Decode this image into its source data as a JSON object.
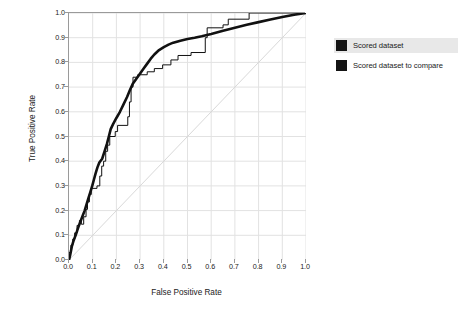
{
  "chart_data": {
    "type": "line",
    "title": "",
    "xlabel": "False Positive Rate",
    "ylabel": "True Positive Rate",
    "xlim": [
      0.0,
      1.0
    ],
    "ylim": [
      0.0,
      1.0
    ],
    "grid": true,
    "legend_position": "right",
    "reference_line": {
      "name": "chance-diagonal",
      "from": [
        0.0,
        0.0
      ],
      "to": [
        1.0,
        1.0
      ],
      "color": "#d8d8d8"
    },
    "xticks": [
      "0.0",
      "0.1",
      "0.2",
      "0.3",
      "0.4",
      "0.5",
      "0.6",
      "0.7",
      "0.8",
      "0.9",
      "1.0"
    ],
    "yticks": [
      "0.0",
      "0.1",
      "0.2",
      "0.3",
      "0.4",
      "0.5",
      "0.6",
      "0.7",
      "0.8",
      "0.9",
      "1.0"
    ],
    "xtick_values": [
      0.0,
      0.1,
      0.2,
      0.3,
      0.4,
      0.5,
      0.6,
      0.7,
      0.8,
      0.9,
      1.0
    ],
    "ytick_values": [
      0.0,
      0.1,
      0.2,
      0.3,
      0.4,
      0.5,
      0.6,
      0.7,
      0.8,
      0.9,
      1.0
    ],
    "series": [
      {
        "name": "Scored dataset",
        "color": "#111111",
        "width": 2.6,
        "style": "smooth",
        "points": [
          [
            0.0,
            0.0
          ],
          [
            0.005,
            0.02
          ],
          [
            0.012,
            0.055
          ],
          [
            0.02,
            0.08
          ],
          [
            0.028,
            0.1
          ],
          [
            0.035,
            0.12
          ],
          [
            0.042,
            0.14
          ],
          [
            0.05,
            0.16
          ],
          [
            0.058,
            0.18
          ],
          [
            0.066,
            0.2
          ],
          [
            0.074,
            0.225
          ],
          [
            0.082,
            0.25
          ],
          [
            0.09,
            0.275
          ],
          [
            0.098,
            0.3
          ],
          [
            0.105,
            0.325
          ],
          [
            0.112,
            0.35
          ],
          [
            0.12,
            0.375
          ],
          [
            0.128,
            0.395
          ],
          [
            0.14,
            0.41
          ],
          [
            0.15,
            0.44
          ],
          [
            0.16,
            0.47
          ],
          [
            0.168,
            0.5
          ],
          [
            0.176,
            0.53
          ],
          [
            0.186,
            0.55
          ],
          [
            0.2,
            0.575
          ],
          [
            0.215,
            0.6
          ],
          [
            0.23,
            0.63
          ],
          [
            0.245,
            0.66
          ],
          [
            0.258,
            0.69
          ],
          [
            0.27,
            0.715
          ],
          [
            0.285,
            0.735
          ],
          [
            0.3,
            0.755
          ],
          [
            0.315,
            0.775
          ],
          [
            0.33,
            0.795
          ],
          [
            0.345,
            0.815
          ],
          [
            0.36,
            0.832
          ],
          [
            0.38,
            0.85
          ],
          [
            0.4,
            0.862
          ],
          [
            0.42,
            0.872
          ],
          [
            0.44,
            0.88
          ],
          [
            0.47,
            0.888
          ],
          [
            0.5,
            0.895
          ],
          [
            0.53,
            0.9
          ],
          [
            0.56,
            0.906
          ],
          [
            0.6,
            0.915
          ],
          [
            0.65,
            0.928
          ],
          [
            0.7,
            0.94
          ],
          [
            0.75,
            0.952
          ],
          [
            0.8,
            0.963
          ],
          [
            0.85,
            0.974
          ],
          [
            0.9,
            0.984
          ],
          [
            0.95,
            0.993
          ],
          [
            1.0,
            1.0
          ]
        ]
      },
      {
        "name": "Scored dataset to compare",
        "color": "#111111",
        "width": 1.0,
        "style": "step",
        "points": [
          [
            0.0,
            0.0
          ],
          [
            0.0,
            0.03
          ],
          [
            0.008,
            0.03
          ],
          [
            0.008,
            0.06
          ],
          [
            0.016,
            0.06
          ],
          [
            0.016,
            0.085
          ],
          [
            0.024,
            0.085
          ],
          [
            0.024,
            0.11
          ],
          [
            0.034,
            0.11
          ],
          [
            0.034,
            0.14
          ],
          [
            0.044,
            0.14
          ],
          [
            0.044,
            0.16
          ],
          [
            0.052,
            0.16
          ],
          [
            0.052,
            0.145
          ],
          [
            0.062,
            0.145
          ],
          [
            0.062,
            0.175
          ],
          [
            0.072,
            0.175
          ],
          [
            0.072,
            0.205
          ],
          [
            0.078,
            0.205
          ],
          [
            0.078,
            0.235
          ],
          [
            0.086,
            0.235
          ],
          [
            0.086,
            0.265
          ],
          [
            0.094,
            0.265
          ],
          [
            0.094,
            0.29
          ],
          [
            0.118,
            0.29
          ],
          [
            0.118,
            0.3
          ],
          [
            0.13,
            0.3
          ],
          [
            0.13,
            0.34
          ],
          [
            0.138,
            0.34
          ],
          [
            0.138,
            0.38
          ],
          [
            0.146,
            0.38
          ],
          [
            0.146,
            0.4
          ],
          [
            0.155,
            0.4
          ],
          [
            0.155,
            0.44
          ],
          [
            0.163,
            0.44
          ],
          [
            0.163,
            0.465
          ],
          [
            0.172,
            0.465
          ],
          [
            0.172,
            0.5
          ],
          [
            0.195,
            0.5
          ],
          [
            0.195,
            0.52
          ],
          [
            0.205,
            0.52
          ],
          [
            0.205,
            0.545
          ],
          [
            0.248,
            0.545
          ],
          [
            0.248,
            0.58
          ],
          [
            0.255,
            0.58
          ],
          [
            0.255,
            0.64
          ],
          [
            0.262,
            0.64
          ],
          [
            0.262,
            0.7
          ],
          [
            0.27,
            0.7
          ],
          [
            0.27,
            0.74
          ],
          [
            0.29,
            0.74
          ],
          [
            0.29,
            0.75
          ],
          [
            0.33,
            0.75
          ],
          [
            0.33,
            0.762
          ],
          [
            0.36,
            0.762
          ],
          [
            0.36,
            0.775
          ],
          [
            0.395,
            0.775
          ],
          [
            0.395,
            0.79
          ],
          [
            0.43,
            0.79
          ],
          [
            0.43,
            0.81
          ],
          [
            0.46,
            0.81
          ],
          [
            0.46,
            0.828
          ],
          [
            0.515,
            0.828
          ],
          [
            0.515,
            0.84
          ],
          [
            0.575,
            0.84
          ],
          [
            0.575,
            0.9
          ],
          [
            0.583,
            0.9
          ],
          [
            0.583,
            0.94
          ],
          [
            0.65,
            0.94
          ],
          [
            0.65,
            0.952
          ],
          [
            0.672,
            0.952
          ],
          [
            0.672,
            0.975
          ],
          [
            0.76,
            0.975
          ],
          [
            0.76,
            1.0
          ],
          [
            1.0,
            1.0
          ]
        ]
      }
    ]
  },
  "axes": {
    "xlabel": "False Positive Rate",
    "ylabel": "True Positive Rate"
  },
  "legend": {
    "items": [
      {
        "label": "Scored dataset",
        "swatch_color": "#141414",
        "highlighted": true
      },
      {
        "label": "Scored dataset to compare",
        "swatch_color": "#141414",
        "highlighted": false
      }
    ]
  },
  "colors": {
    "background": "#ffffff",
    "grid": "#e2e2e2",
    "axis": "#9a9a9a",
    "curve": "#111111",
    "diagonal": "#d8d8d8",
    "legend_highlight": "#e8e8e8"
  }
}
